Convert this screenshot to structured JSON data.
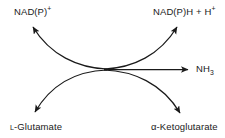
{
  "diagram": {
    "stroke_color": "#1a1a1a",
    "background_color": "#ffffff",
    "text_color": "#1a1a1a",
    "nodes": {
      "cofactor_in": {
        "text_prefix": "NAD(P)",
        "text_super": "+",
        "position": "top-left"
      },
      "cofactor_out": {
        "text_prefix": "NAD(P)H + H",
        "text_super": "+",
        "position": "top-right"
      },
      "substrate": {
        "text_small": "L",
        "text_main": "-Glutamate",
        "position": "bottom-left"
      },
      "product": {
        "text_main": "α-Ketoglutarate",
        "position": "bottom-right"
      },
      "byproduct": {
        "text_prefix": "NH",
        "text_sub": "3",
        "position": "right"
      }
    },
    "arrows": [
      {
        "name": "substrate-to-center",
        "from": "L-Glutamate",
        "to": "center",
        "style": "curved"
      },
      {
        "name": "center-to-cofactor-out",
        "from": "center",
        "to": "NAD(P)H + H+",
        "style": "curved"
      },
      {
        "name": "cofactor-in-to-center",
        "from": "NAD(P)+",
        "to": "center",
        "style": "curved"
      },
      {
        "name": "center-to-product",
        "from": "center",
        "to": "α-Ketoglutarate",
        "style": "curved"
      },
      {
        "name": "center-to-byproduct",
        "from": "center",
        "to": "NH3",
        "style": "straight"
      }
    ]
  }
}
